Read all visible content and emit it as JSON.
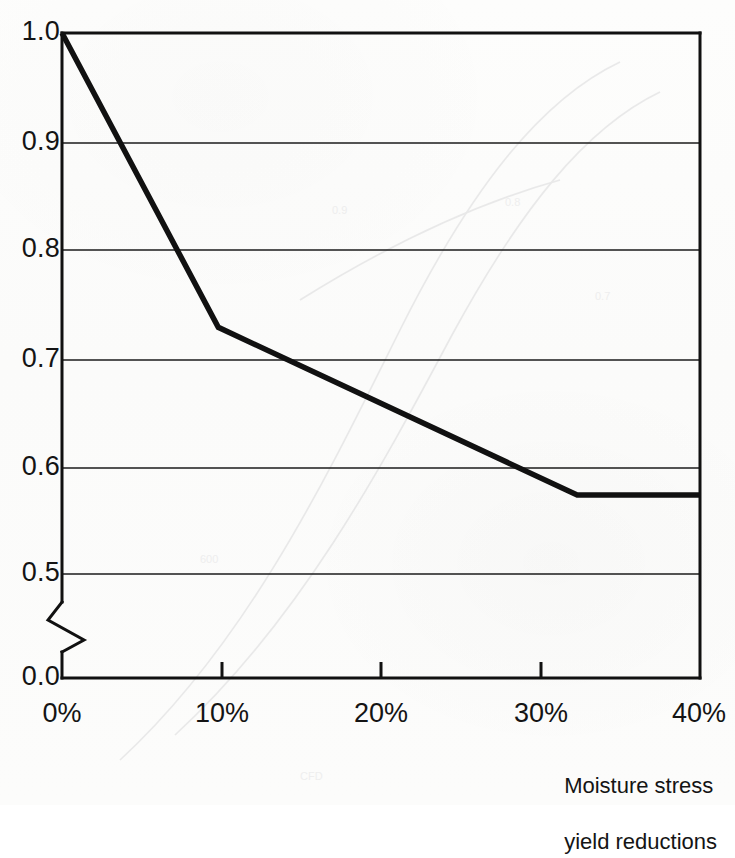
{
  "figure": {
    "background_color": "#fcfcfb",
    "ink_color": "#111111"
  },
  "axis_caption": {
    "line1": "Moisture stress",
    "line2": "yield reductions"
  },
  "y_ticks": [
    {
      "label": "1.0",
      "value": 1.0,
      "y": 33
    },
    {
      "label": "0.9",
      "value": 0.9,
      "y": 143
    },
    {
      "label": "0.8",
      "value": 0.8,
      "y": 250
    },
    {
      "label": "0.7",
      "value": 0.7,
      "y": 360
    },
    {
      "label": "0.6",
      "value": 0.6,
      "y": 468
    },
    {
      "label": "0.5",
      "value": 0.5,
      "y": 574
    },
    {
      "label": "0.0",
      "value": 0.0,
      "y": 678
    }
  ],
  "x_ticks": [
    {
      "label": "0%",
      "value": 0,
      "x": 62
    },
    {
      "label": "10%",
      "value": 10,
      "x": 222
    },
    {
      "label": "20%",
      "value": 20,
      "x": 381
    },
    {
      "label": "30%",
      "value": 30,
      "x": 541
    },
    {
      "label": "40%",
      "value": 40,
      "x": 700
    }
  ],
  "axis_break": {
    "present": true,
    "between": [
      "0.5",
      "0.0"
    ],
    "note": "zigzag break on y-axis"
  },
  "chart_data": {
    "type": "line",
    "title": "",
    "subtitle": "",
    "xlabel": "Moisture stress yield reductions",
    "ylabel": "",
    "x": [
      0,
      9.8,
      32.3,
      40
    ],
    "values": [
      1.0,
      0.728,
      0.573,
      0.573
    ],
    "series": [
      {
        "name": "yield response factor",
        "points": [
          {
            "x": 0,
            "y": 1.0
          },
          {
            "x": 9.8,
            "y": 0.728
          },
          {
            "x": 32.3,
            "y": 0.573
          },
          {
            "x": 40,
            "y": 0.573
          }
        ]
      }
    ],
    "xlim": [
      0,
      40
    ],
    "ylim": [
      0.5,
      1.0
    ],
    "y_axis_broken_to": 0.0,
    "xtick_labels": [
      "0%",
      "10%",
      "20%",
      "30%",
      "40%"
    ],
    "ytick_labels": [
      "1.0",
      "0.9",
      "0.8",
      "0.7",
      "0.6",
      "0.5",
      "0.0"
    ],
    "grid": "horizontal",
    "legend": "none",
    "line_color": "#111111",
    "line_width": 5
  }
}
